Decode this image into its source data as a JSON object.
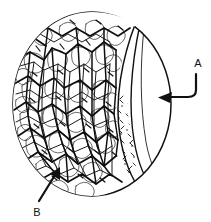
{
  "figure": {
    "kind": "circular-micrograph-line-drawing",
    "title": "",
    "background_color": "#ffffff",
    "ink_color": "#111111",
    "canvas": {
      "width": 211,
      "height": 222
    },
    "outline": {
      "shape": "circle",
      "center_x": 92,
      "center_y": 104,
      "radius_x": 79,
      "radius_y": 92,
      "stroke_width": 1.4
    },
    "regions": [
      {
        "id": "trabecular-mass",
        "name": "dense cellular trabecular network",
        "texture": "irregular polygonal cell network",
        "fill_color": "#ffffff",
        "line_color": "#111111",
        "coverage": "left two-thirds of the circle"
      },
      {
        "id": "stippled-band",
        "name": "stippled transition band",
        "texture": "short dash and comma stipple marks",
        "fill_color": "#ffffff",
        "line_color": "#222222",
        "coverage": "narrow curved band at lower-right of the mass"
      },
      {
        "id": "clear-lune",
        "name": "smooth crescent region",
        "texture": "blank",
        "fill_color": "#ffffff",
        "line_color": "#111111",
        "coverage": "right crescent bounded by nested arcs"
      }
    ],
    "arcs": [
      {
        "id": "inner-arc-1",
        "note": "inner boundary of crescent, convex left"
      },
      {
        "id": "inner-arc-2",
        "note": "second nested arc inside crescent"
      }
    ]
  },
  "labels": [
    {
      "id": "label-a",
      "text": "A",
      "text_x": 198,
      "text_y": 66,
      "points_to": "clear-lune",
      "leader": {
        "type": "bent-arrow",
        "direction": "left",
        "start_x": 196,
        "start_y": 74,
        "bend_x": 196,
        "bend_y": 94,
        "tip_x": 159,
        "tip_y": 98
      }
    },
    {
      "id": "label-b",
      "text": "B",
      "text_x": 37,
      "text_y": 214,
      "points_to": "trabecular-mass",
      "leader": {
        "type": "straight-arrow",
        "direction": "up-right",
        "start_x": 40,
        "start_y": 202,
        "tip_x": 59,
        "tip_y": 170
      }
    }
  ]
}
